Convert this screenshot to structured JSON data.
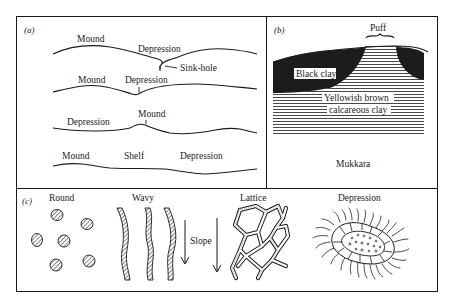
{
  "figure": {
    "frame": {
      "x": 16,
      "y": 16,
      "w": 422,
      "h": 276
    },
    "colors": {
      "ink": "#1a1a1a",
      "paper": "#ffffff",
      "hatch": "#555555"
    }
  },
  "panel_a": {
    "label": "(a)",
    "profiles": [
      {
        "labels": [
          "Mound",
          "Depression"
        ],
        "annotation": "Sink-hole"
      },
      {
        "labels": [
          "Mound",
          "Depression"
        ]
      },
      {
        "labels": [
          "Depression",
          "Mound"
        ]
      },
      {
        "labels": [
          "Mound",
          "Shelf",
          "Depression"
        ]
      }
    ]
  },
  "panel_b": {
    "label": "(b)",
    "puff_label": "Puff",
    "black_clay_label": "Black clay",
    "calcareous_label_line1": "Yellowish brown",
    "calcareous_label_line2": "calcareous clay",
    "caption": "Mukkara"
  },
  "panel_c": {
    "label": "(c)",
    "patterns": [
      {
        "name": "Round"
      },
      {
        "name": "Wavy"
      },
      {
        "name": "Lattice"
      },
      {
        "name": "Depression"
      }
    ],
    "slope_label": "Slope"
  }
}
